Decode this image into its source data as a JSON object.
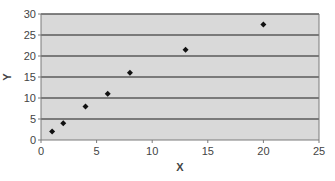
{
  "chart_data": {
    "type": "scatter",
    "title": "",
    "xlabel": "X",
    "ylabel": "Y",
    "xlim": [
      0,
      25
    ],
    "ylim": [
      0,
      30
    ],
    "xticks": [
      0,
      5,
      10,
      15,
      20,
      25
    ],
    "yticks": [
      0,
      5,
      10,
      15,
      20,
      25,
      30
    ],
    "grid": {
      "horizontal": true,
      "vertical": false
    },
    "legend": null,
    "series": [
      {
        "name": "Series 1",
        "marker": "diamond",
        "points": [
          {
            "x": 1,
            "y": 2
          },
          {
            "x": 2,
            "y": 4
          },
          {
            "x": 4,
            "y": 8
          },
          {
            "x": 6,
            "y": 11
          },
          {
            "x": 8,
            "y": 16
          },
          {
            "x": 13,
            "y": 21.5
          },
          {
            "x": 20,
            "y": 27.5
          }
        ]
      }
    ]
  },
  "colors": {
    "plot_background": "#d9d9d9",
    "gridline": "#5a5a5a",
    "axis": "#7a7a7a",
    "marker": "#111111",
    "text": "#444444"
  }
}
